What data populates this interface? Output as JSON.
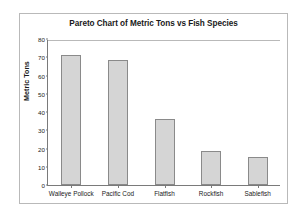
{
  "chart_data": {
    "type": "bar",
    "title": "Pareto Chart of Metric Tons vs Fish Species",
    "xlabel": "",
    "ylabel": "Metric Tons",
    "categories": [
      "Walleye Pollock",
      "Pacific Cod",
      "Flatfish",
      "Rockfish",
      "Sablefish"
    ],
    "values": [
      71,
      68.5,
      36,
      18.8,
      15.5
    ],
    "ylim": [
      0,
      80
    ],
    "yticks": [
      0,
      10,
      20,
      30,
      40,
      50,
      60,
      70,
      80
    ],
    "ytick_labels": [
      "0",
      "10",
      "20",
      "30",
      "40",
      "50",
      "60",
      "70",
      "80"
    ],
    "grid": false,
    "legend": null,
    "bar_color": "#d5d5d5",
    "bar_edge_color": "#8a8a8a",
    "axis_color": "#7a7a7a",
    "frame_color": "#b9b9b9",
    "background": "#ffffff"
  }
}
